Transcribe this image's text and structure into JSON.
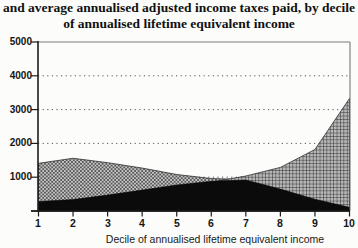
{
  "title": {
    "line1": "and average annualised adjusted income taxes paid, by decile",
    "line2": "of annualised lifetime equivalent income"
  },
  "chart_data": {
    "type": "area",
    "overlay": true,
    "title_line1": "and average annualised adjusted income taxes paid, by decile",
    "title_line2": "of annualised lifetime equivalent income",
    "xlabel": "Decile of annualised lifetime equivalent income",
    "x": [
      1,
      2,
      3,
      4,
      5,
      6,
      7,
      8,
      9,
      10
    ],
    "ylim": [
      0,
      5000
    ],
    "ytick_step": 1000,
    "ytick_labels": [
      "5000",
      "4000",
      "3000",
      "2000",
      "1000"
    ],
    "gridline_values": [
      1000,
      2000,
      3000,
      4000
    ],
    "grid_style": "dotted-horizontal",
    "legend": "none visible",
    "series": [
      {
        "name": "crosshatch-gray-area",
        "pattern": "crosshatch",
        "values": [
          1410,
          1560,
          1430,
          1270,
          1080,
          960,
          930,
          905,
          885,
          870
        ]
      },
      {
        "name": "lattice-area",
        "pattern": "lattice",
        "values": [
          120,
          180,
          280,
          430,
          640,
          855,
          1035,
          1290,
          1820,
          3330
        ]
      },
      {
        "name": "solid-black-area",
        "pattern": "solid",
        "values": [
          280,
          340,
          470,
          620,
          770,
          880,
          920,
          650,
          350,
          110
        ]
      }
    ],
    "colors": {
      "ink": "#141414",
      "crosshatch_bg": "#c9c9c9",
      "crosshatch_line": "#565656",
      "lattice_bg": "#b7b7b7",
      "lattice_line": "#222222",
      "solid": "#0b0b0b"
    }
  }
}
